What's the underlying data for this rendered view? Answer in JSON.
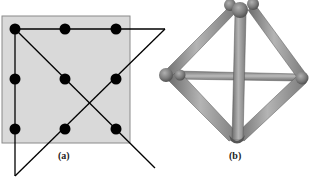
{
  "figure": {
    "panel_a": {
      "label": "(a)",
      "description": "nine-dot puzzle solved with four straight lines extending outside the square",
      "grid": {
        "rows": 3,
        "cols": 3
      },
      "colors": {
        "square_fill": "#d9d9d9",
        "square_border": "#8a8a8a",
        "dot": "#000000",
        "line": "#000000"
      }
    },
    "panel_b": {
      "label": "(b)",
      "description": "three-dimensional tetrahedron-like stick model built from six rods",
      "colors": {
        "rod": "#9a9a9a",
        "rod_shadow": "#6e6e6e",
        "joint": "#7d7d7d"
      }
    }
  }
}
